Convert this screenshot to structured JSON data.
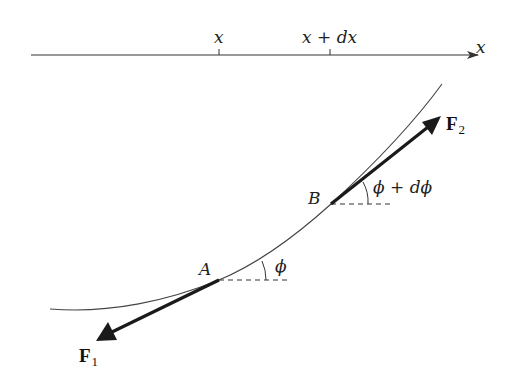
{
  "axis": {
    "label": "x",
    "ticks": [
      {
        "label": "x"
      },
      {
        "label": "x + dx"
      }
    ]
  },
  "points": {
    "A": "A",
    "B": "B"
  },
  "angles": {
    "at_A": "ϕ",
    "at_B": "ϕ + dϕ"
  },
  "forces": {
    "F1": {
      "symbol": "F",
      "subscript": "1"
    },
    "F2": {
      "symbol": "F",
      "subscript": "2"
    }
  },
  "colors": {
    "line": "#333333",
    "arrow": "#1a1a1a"
  }
}
